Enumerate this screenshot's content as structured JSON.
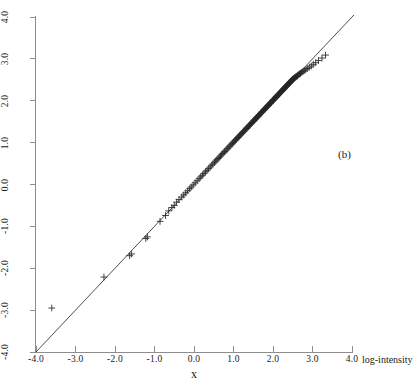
{
  "figure": {
    "panel_label": "(b)",
    "background_color": "#ffffff",
    "width": 418,
    "height": 389
  },
  "axes": {
    "x_title": "x",
    "x_unit_label": "log-intensity",
    "y_title": "inverse distribution function",
    "x_tick_labels": [
      "-4.0",
      "-3.0",
      "-2.0",
      "-1.0",
      "0.0",
      "1.0",
      "2.0",
      "3.0",
      "4.0"
    ],
    "y_tick_labels": [
      "-4.0",
      "-3.0",
      "-2.0",
      "-1.0",
      "0.0",
      "1.0",
      "2.0",
      "3.0",
      "4.0"
    ],
    "axis_color": "#8d8d8d"
  },
  "chart_data": {
    "type": "scatter",
    "title": "",
    "subtitle": "",
    "annotations": [
      "(b)"
    ],
    "xlabel": "x",
    "ylabel": "inverse distribution function",
    "x_unit_label": "log-intensity",
    "xlim": [
      -4.0,
      4.0
    ],
    "ylim": [
      -4.0,
      4.0
    ],
    "xticks": [
      -4,
      -3,
      -2,
      -1,
      0,
      1,
      2,
      3,
      4
    ],
    "yticks": [
      -4,
      -3,
      -2,
      -1,
      0,
      1,
      2,
      3,
      4
    ],
    "grid": false,
    "legend": false,
    "marker": "plus",
    "marker_color": "#262626",
    "marker_size": 3.4,
    "reference_line": {
      "type": "identity",
      "from": [
        -4.0,
        -4.0
      ],
      "to": [
        4.05,
        4.05
      ],
      "color": "#3a3a3a",
      "width": 0.9
    },
    "series": [
      {
        "name": "quantiles",
        "x": [
          -3.6,
          -2.28,
          -1.63,
          -1.58,
          -1.22,
          -1.18,
          -0.86,
          -0.72,
          -0.64,
          -0.56,
          -0.5,
          -0.44,
          -0.38,
          -0.31,
          -0.26,
          -0.21,
          -0.16,
          -0.11,
          -0.07,
          -0.02,
          0.03,
          0.08,
          0.13,
          0.17,
          0.21,
          0.25,
          0.29,
          0.33,
          0.37,
          0.41,
          0.45,
          0.48,
          0.52,
          0.55,
          0.58,
          0.61,
          0.64,
          0.67,
          0.7,
          0.73,
          0.76,
          0.78,
          0.81,
          0.84,
          0.86,
          0.89,
          0.91,
          0.94,
          0.96,
          0.98,
          1.0,
          1.03,
          1.05,
          1.07,
          1.09,
          1.11,
          1.13,
          1.15,
          1.17,
          1.19,
          1.21,
          1.23,
          1.25,
          1.27,
          1.29,
          1.31,
          1.33,
          1.34,
          1.36,
          1.38,
          1.4,
          1.41,
          1.43,
          1.45,
          1.46,
          1.48,
          1.5,
          1.51,
          1.53,
          1.54,
          1.56,
          1.57,
          1.59,
          1.6,
          1.62,
          1.63,
          1.65,
          1.66,
          1.68,
          1.69,
          1.71,
          1.72,
          1.73,
          1.75,
          1.76,
          1.77,
          1.79,
          1.8,
          1.81,
          1.83,
          1.84,
          1.85,
          1.87,
          1.88,
          1.89,
          1.9,
          1.92,
          1.93,
          1.94,
          1.95,
          1.96,
          1.98,
          1.99,
          2.0,
          2.01,
          2.02,
          2.03,
          2.05,
          2.06,
          2.07,
          2.08,
          2.09,
          2.1,
          2.11,
          2.12,
          2.13,
          2.14,
          2.15,
          2.16,
          2.18,
          2.19,
          2.2,
          2.21,
          2.22,
          2.23,
          2.24,
          2.25,
          2.26,
          2.27,
          2.28,
          2.29,
          2.3,
          2.31,
          2.32,
          2.33,
          2.34,
          2.35,
          2.36,
          2.37,
          2.38,
          2.39,
          2.4,
          2.41,
          2.42,
          2.43,
          2.44,
          2.45,
          2.46,
          2.47,
          2.48,
          2.49,
          2.5,
          2.51,
          2.52,
          2.54,
          2.55,
          2.56,
          2.58,
          2.59,
          2.61,
          2.62,
          2.64,
          2.66,
          2.68,
          2.7,
          2.73,
          2.76,
          2.79,
          2.83,
          2.87,
          2.92,
          2.97,
          3.02,
          3.08,
          3.15,
          3.24,
          3.33
        ],
        "y": [
          -2.95,
          -2.21,
          -1.7,
          -1.66,
          -1.29,
          -1.25,
          -0.88,
          -0.74,
          -0.63,
          -0.55,
          -0.5,
          -0.42,
          -0.36,
          -0.3,
          -0.25,
          -0.2,
          -0.15,
          -0.1,
          -0.06,
          -0.01,
          0.04,
          0.09,
          0.14,
          0.18,
          0.22,
          0.26,
          0.3,
          0.34,
          0.38,
          0.42,
          0.46,
          0.49,
          0.53,
          0.56,
          0.59,
          0.62,
          0.65,
          0.68,
          0.71,
          0.74,
          0.77,
          0.79,
          0.82,
          0.85,
          0.87,
          0.9,
          0.92,
          0.95,
          0.97,
          0.99,
          1.01,
          1.04,
          1.06,
          1.08,
          1.1,
          1.12,
          1.14,
          1.16,
          1.18,
          1.2,
          1.22,
          1.24,
          1.26,
          1.28,
          1.3,
          1.32,
          1.34,
          1.35,
          1.37,
          1.39,
          1.41,
          1.42,
          1.44,
          1.46,
          1.47,
          1.49,
          1.51,
          1.52,
          1.54,
          1.55,
          1.57,
          1.58,
          1.6,
          1.61,
          1.63,
          1.64,
          1.66,
          1.67,
          1.69,
          1.7,
          1.72,
          1.73,
          1.74,
          1.76,
          1.77,
          1.78,
          1.8,
          1.81,
          1.82,
          1.84,
          1.85,
          1.86,
          1.88,
          1.89,
          1.9,
          1.91,
          1.93,
          1.94,
          1.95,
          1.96,
          1.97,
          1.99,
          2.0,
          2.01,
          2.02,
          2.03,
          2.04,
          2.06,
          2.07,
          2.08,
          2.09,
          2.1,
          2.11,
          2.12,
          2.13,
          2.14,
          2.15,
          2.16,
          2.17,
          2.19,
          2.2,
          2.21,
          2.22,
          2.23,
          2.24,
          2.25,
          2.26,
          2.27,
          2.28,
          2.29,
          2.3,
          2.31,
          2.32,
          2.33,
          2.34,
          2.35,
          2.36,
          2.37,
          2.38,
          2.39,
          2.4,
          2.41,
          2.42,
          2.43,
          2.44,
          2.45,
          2.46,
          2.47,
          2.48,
          2.49,
          2.5,
          2.51,
          2.52,
          2.53,
          2.54,
          2.55,
          2.56,
          2.57,
          2.58,
          2.59,
          2.6,
          2.62,
          2.63,
          2.65,
          2.66,
          2.68,
          2.7,
          2.72,
          2.74,
          2.77,
          2.8,
          2.83,
          2.87,
          2.91,
          2.96,
          3.02,
          3.09
        ]
      }
    ]
  }
}
